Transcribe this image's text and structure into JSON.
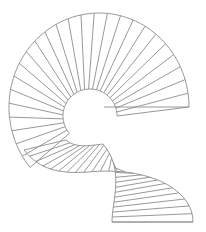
{
  "diagram": {
    "stroke_color": "#8c8c8c",
    "background": "#ffffff",
    "upper_flight": {
      "outer": {
        "cx": 99,
        "cy": 107,
        "rx": 90,
        "ry": 94,
        "start_deg": 180,
        "end_deg": 360,
        "extra_left_deg": 40
      },
      "inner": {
        "cx": 90,
        "cy": 116,
        "r": 27
      },
      "end_line": [
        [
          104,
          107
        ],
        [
          189,
          107
        ]
      ],
      "treads": 26
    },
    "lower_flight": {
      "outer_path": "M24,150 C40,170 60,174 88,172 C150,166 193,190 193,222",
      "inner_path": "M66,140 C75,148 88,146 103,144 C125,170 112,200 112,222",
      "end_line": [
        [
          112,
          222
        ],
        [
          193,
          222
        ]
      ],
      "treads": 24
    }
  }
}
